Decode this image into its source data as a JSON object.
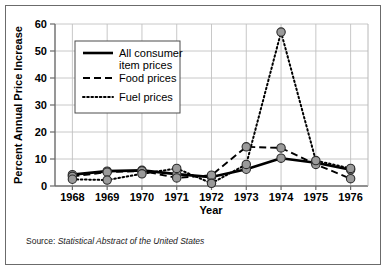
{
  "chart_data": {
    "type": "line",
    "title": "",
    "xlabel": "Year",
    "ylabel": "Percent Annual Price Increase",
    "categories": [
      1968,
      1969,
      1970,
      1971,
      1972,
      1973,
      1974,
      1975,
      1976
    ],
    "x_tick_labels": [
      "1968",
      "1969",
      "1970",
      "1971",
      "1972",
      "1973",
      "1974",
      "1975",
      "1976"
    ],
    "y_tick_labels": [
      "0",
      "10",
      "20",
      "30",
      "40",
      "50",
      "60"
    ],
    "y_ticks": [
      0,
      10,
      20,
      30,
      40,
      50,
      60
    ],
    "ylim": [
      0,
      60
    ],
    "grid": true,
    "legend_position": "upper-left",
    "marker": "circle",
    "marker_fill": "#9a9a9a",
    "marker_edge": "#2b2b2b",
    "series": [
      {
        "name": "All consumer item prices",
        "style": "solid",
        "color": "#000000",
        "values": [
          4.2,
          5.5,
          5.8,
          4.4,
          3.3,
          6.2,
          10.3,
          8.6,
          6.0
        ]
      },
      {
        "name": "Food prices",
        "style": "dashed",
        "color": "#000000",
        "values": [
          3.6,
          5.1,
          5.6,
          3.0,
          4.0,
          14.5,
          14.1,
          8.0,
          2.7
        ]
      },
      {
        "name": "Fuel prices",
        "style": "dotted",
        "color": "#000000",
        "values": [
          2.5,
          2.2,
          4.5,
          6.5,
          1.0,
          8.0,
          57.0,
          9.4,
          6.5
        ]
      }
    ]
  },
  "legend": {
    "items": [
      {
        "label_line1": "All consumer",
        "label_line2": "item prices",
        "style": "solid"
      },
      {
        "label_line1": "Food prices",
        "label_line2": "",
        "style": "dashed"
      },
      {
        "label_line1": "Fuel prices",
        "label_line2": "",
        "style": "dotted"
      }
    ]
  },
  "source": {
    "prefix": "Source:",
    "citation": "Statistical Abstract of the United States"
  }
}
